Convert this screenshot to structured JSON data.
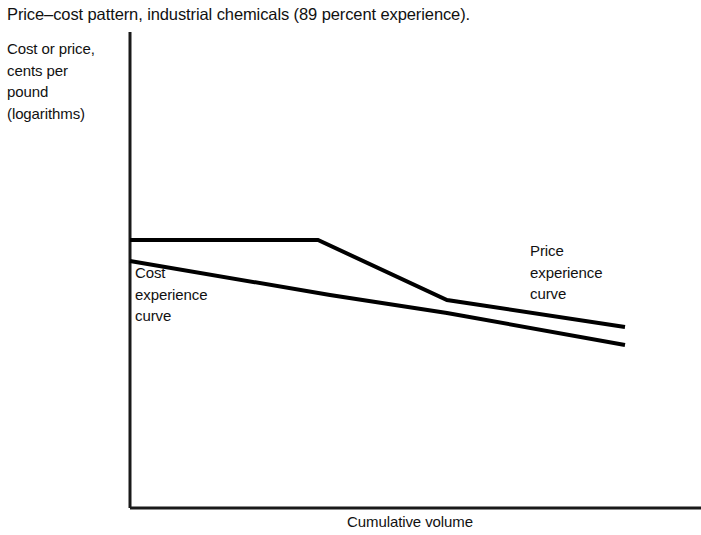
{
  "figure": {
    "title": "Price–cost pattern, industrial chemicals (89 percent experience).",
    "background_color": "#ffffff",
    "ink_color": "#111111"
  },
  "axes": {
    "y_label_lines": [
      "Cost or price,",
      "cents per",
      "pound",
      "(logarithms)"
    ],
    "x_label": "Cumulative volume"
  },
  "annotations": {
    "cost_curve_label_lines": [
      "Cost",
      "experience",
      "curve"
    ],
    "price_curve_label_lines": [
      "Price",
      "experience",
      "curve"
    ]
  },
  "chart_data": {
    "type": "line",
    "title": "Price–cost pattern, industrial chemicals (89 percent experience).",
    "xlabel": "Cumulative volume",
    "ylabel": "Cost or price, cents per pound (logarithms)",
    "scale": "log-log",
    "axis_ticks": "none",
    "grid": false,
    "legend": "inline-annotations",
    "xlim": [
      0,
      1
    ],
    "ylim": [
      0,
      1
    ],
    "annotation_note": "89 percent experience curve; price stays flat (umbrella) then shakes out to parallel the cost curve",
    "series": [
      {
        "name": "Price experience curve",
        "label_lines": [
          "Price",
          "experience",
          "curve"
        ],
        "stroke_width_px": 4,
        "color": "#000000",
        "points_px": [
          {
            "x": 130,
            "y": 240
          },
          {
            "x": 318,
            "y": 240
          },
          {
            "x": 447,
            "y": 300
          },
          {
            "x": 625,
            "y": 327
          }
        ],
        "points_normalized": [
          {
            "x": 0.0,
            "y": 0.562
          },
          {
            "x": 0.38,
            "y": 0.562
          },
          {
            "x": 0.64,
            "y": 0.436
          },
          {
            "x": 1.0,
            "y": 0.38
          }
        ]
      },
      {
        "name": "Cost experience curve",
        "label_lines": [
          "Cost",
          "experience",
          "curve"
        ],
        "stroke_width_px": 4,
        "color": "#000000",
        "points_px": [
          {
            "x": 130,
            "y": 261
          },
          {
            "x": 330,
            "y": 295
          },
          {
            "x": 447,
            "y": 313
          },
          {
            "x": 625,
            "y": 345
          }
        ],
        "points_normalized": [
          {
            "x": 0.0,
            "y": 0.518
          },
          {
            "x": 0.404,
            "y": 0.447
          },
          {
            "x": 0.64,
            "y": 0.409
          },
          {
            "x": 1.0,
            "y": 0.342
          }
        ]
      }
    ],
    "axis_geometry_px": {
      "y_axis_x": 130,
      "y_axis_top": 32,
      "y_axis_bottom": 508,
      "x_axis_y": 508,
      "x_axis_left": 130,
      "x_axis_right": 701,
      "axis_stroke_width_px": 3
    }
  }
}
